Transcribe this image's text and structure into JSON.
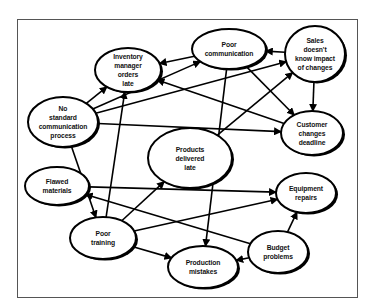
{
  "diagram": {
    "colors": {
      "line": "#000000",
      "node_fill": "#ffffff",
      "frame": "#555555"
    },
    "nodes": [
      {
        "id": "inventory",
        "label": "Inventory manager orders late",
        "lines": [
          "Inventory",
          "manager",
          "orders",
          "late"
        ],
        "cx": 128,
        "cy": 70,
        "rx": 33,
        "ry": 22
      },
      {
        "id": "poor_comm",
        "label": "Poor communication",
        "lines": [
          "Poor",
          "communication"
        ],
        "cx": 229,
        "cy": 49,
        "rx": 37,
        "ry": 20
      },
      {
        "id": "sales",
        "label": "Sales doesn't know impact of changes",
        "lines": [
          "Sales",
          "doesn't",
          "know impact",
          "of changes"
        ],
        "cx": 315,
        "cy": 54,
        "rx": 30,
        "ry": 28
      },
      {
        "id": "no_std",
        "label": "No standard communication process",
        "lines": [
          "No",
          "standard",
          "communication",
          "process"
        ],
        "cx": 63,
        "cy": 122,
        "rx": 35,
        "ry": 25
      },
      {
        "id": "customer",
        "label": "Customer changes deadline",
        "lines": [
          "Customer",
          "changes",
          "deadline"
        ],
        "cx": 312,
        "cy": 133,
        "rx": 31,
        "ry": 22
      },
      {
        "id": "products_late",
        "label": "Products delivered late",
        "lines": [
          "Products",
          "delivered",
          "late"
        ],
        "cx": 190,
        "cy": 158,
        "rx": 42,
        "ry": 30
      },
      {
        "id": "flawed",
        "label": "Flawed materials",
        "lines": [
          "Flawed",
          "materials"
        ],
        "cx": 57,
        "cy": 186,
        "rx": 32,
        "ry": 19
      },
      {
        "id": "equipment",
        "label": "Equipment repairs",
        "lines": [
          "Equipment",
          "repairs"
        ],
        "cx": 306,
        "cy": 193,
        "rx": 30,
        "ry": 20
      },
      {
        "id": "poor_training",
        "label": "Poor training",
        "lines": [
          "Poor",
          "training"
        ],
        "cx": 103,
        "cy": 238,
        "rx": 33,
        "ry": 21
      },
      {
        "id": "budget",
        "label": "Budget problems",
        "lines": [
          "Budget",
          "problems"
        ],
        "cx": 278,
        "cy": 252,
        "rx": 30,
        "ry": 21
      },
      {
        "id": "production",
        "label": "Production mistakes",
        "lines": [
          "Production",
          "mistakes"
        ],
        "cx": 203,
        "cy": 267,
        "rx": 35,
        "ry": 21
      }
    ],
    "edges": [
      {
        "from": "no_std",
        "to": "inventory"
      },
      {
        "from": "no_std",
        "to": "poor_comm"
      },
      {
        "from": "no_std",
        "to": "sales"
      },
      {
        "from": "no_std",
        "to": "customer"
      },
      {
        "from": "no_std",
        "to": "poor_training"
      },
      {
        "from": "poor_comm",
        "to": "inventory"
      },
      {
        "from": "poor_comm",
        "to": "customer"
      },
      {
        "from": "poor_comm",
        "to": "production"
      },
      {
        "from": "sales",
        "to": "poor_comm"
      },
      {
        "from": "sales",
        "to": "customer"
      },
      {
        "from": "customer",
        "to": "inventory"
      },
      {
        "from": "products_late",
        "to": "sales"
      },
      {
        "from": "poor_training",
        "to": "inventory"
      },
      {
        "from": "poor_training",
        "to": "products_late"
      },
      {
        "from": "poor_training",
        "to": "equipment"
      },
      {
        "from": "poor_training",
        "to": "production"
      },
      {
        "from": "flawed",
        "to": "equipment"
      },
      {
        "from": "budget",
        "to": "flawed"
      },
      {
        "from": "budget",
        "to": "equipment"
      },
      {
        "from": "budget",
        "to": "production"
      }
    ]
  }
}
